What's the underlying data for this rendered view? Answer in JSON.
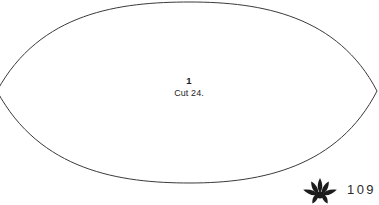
{
  "page": {
    "background_color": "#ffffff",
    "width": 379,
    "height": 205,
    "page_number": "109"
  },
  "pattern": {
    "shape_name": "lens",
    "outline_color": "#3a3a3a",
    "outline_width": 1,
    "fill_color": "#ffffff",
    "piece_number": "1",
    "cut_instruction": "Cut 24.",
    "geometry": {
      "left_vertex_x": -3,
      "right_vertex_x": 377,
      "vertex_y": 91,
      "top_y": 2,
      "bottom_y": 183
    }
  },
  "footer": {
    "ornament_name": "leaf-cluster-ornament",
    "ornament_color": "#1c1c1c",
    "page_number": "109"
  }
}
